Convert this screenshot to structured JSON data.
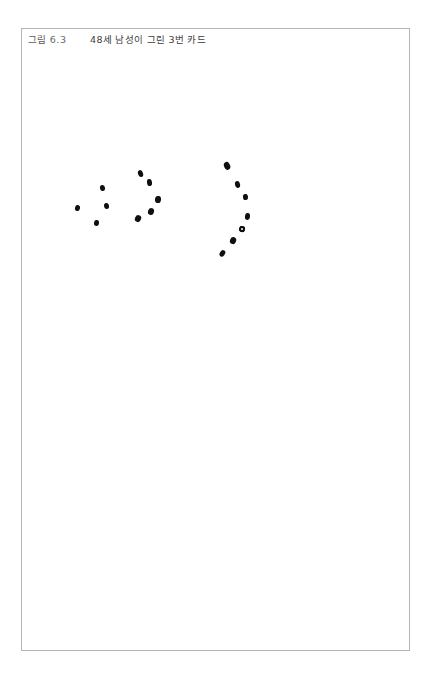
{
  "page": {
    "header_strip_text": "· · ·",
    "background_color": "#ffffff"
  },
  "figure": {
    "frame": {
      "border_color": "#b4b4b4",
      "background_color": "#ffffff",
      "x": 21,
      "y": 28,
      "width": 389,
      "height": 623
    },
    "caption": {
      "label": "그림",
      "number": "6.3",
      "title": "48세 남성이 그린 3번 카드",
      "full_text": "그림 6.3    48세 남성이 그린 3번 카드",
      "color": "#4a4a4a"
    },
    "drawing": {
      "name": "hand-drawn-dot-pattern",
      "ink_color": "#100f0f",
      "description": "세 개의 점 무리로 이루어진 손으로 그린 그림",
      "dot_count": 16,
      "clusters": [
        {
          "name": "left-scatter",
          "dot_count": 4,
          "dots": [
            {
              "cx": 80,
              "cy": 159,
              "w": 5.0,
              "h": 6.2,
              "rot": -12
            },
            {
              "cx": 55,
              "cy": 179,
              "w": 4.8,
              "h": 6.0,
              "rot": 14
            },
            {
              "cx": 84,
              "cy": 177,
              "w": 5.0,
              "h": 5.8,
              "rot": -6
            },
            {
              "cx": 75,
              "cy": 194,
              "w": 5.2,
              "h": 5.8,
              "rot": 8
            }
          ]
        },
        {
          "name": "middle-arc",
          "dot_count": 5,
          "dots": [
            {
              "cx": 119,
              "cy": 144,
              "w": 5.4,
              "h": 7.0,
              "rot": -18
            },
            {
              "cx": 128,
              "cy": 154,
              "w": 5.4,
              "h": 7.4,
              "rot": -8
            },
            {
              "cx": 136,
              "cy": 171,
              "w": 5.8,
              "h": 7.2,
              "rot": 6
            },
            {
              "cx": 129,
              "cy": 182,
              "w": 5.6,
              "h": 7.0,
              "rot": 16
            },
            {
              "cx": 116,
              "cy": 190,
              "w": 5.6,
              "h": 7.2,
              "rot": 26
            }
          ]
        },
        {
          "name": "right-arc",
          "dot_count": 7,
          "dots": [
            {
              "cx": 205,
              "cy": 137,
              "w": 5.6,
              "h": 7.6,
              "rot": -22,
              "style": "solid"
            },
            {
              "cx": 216,
              "cy": 155,
              "w": 5.2,
              "h": 6.6,
              "rot": -10,
              "style": "solid"
            },
            {
              "cx": 223,
              "cy": 168,
              "w": 5.0,
              "h": 6.4,
              "rot": -4,
              "style": "solid"
            },
            {
              "cx": 226,
              "cy": 187,
              "w": 5.2,
              "h": 6.6,
              "rot": 6,
              "style": "solid"
            },
            {
              "cx": 220,
              "cy": 200,
              "w": 5.6,
              "h": 6.4,
              "rot": 14,
              "style": "ring"
            },
            {
              "cx": 211,
              "cy": 212,
              "w": 5.8,
              "h": 7.4,
              "rot": 24,
              "style": "solid"
            },
            {
              "cx": 201,
              "cy": 224,
              "w": 5.4,
              "h": 6.6,
              "rot": 30,
              "style": "solid"
            }
          ]
        }
      ]
    }
  }
}
